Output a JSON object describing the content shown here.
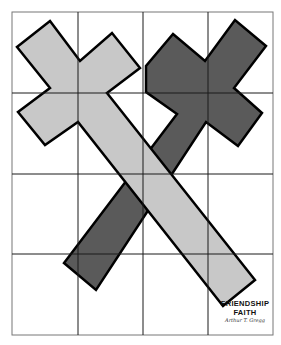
{
  "artwork": {
    "title_line1": "FRIENDSHIP",
    "title_line2": "FAITH",
    "signature": "Arthur T. Gregg",
    "colors": {
      "background": "#ffffff",
      "grid_line": "#1a1a1a",
      "light_cross_fill": "#c8c8c8",
      "dark_cross_fill": "#5a5a5a",
      "outline": "#000000"
    },
    "grid": {
      "columns": 4,
      "rows": 4
    }
  }
}
